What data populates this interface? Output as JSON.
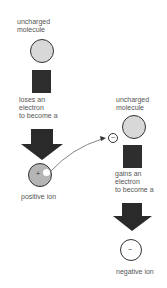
{
  "left": {
    "top_label": [
      "uncharged",
      "molecule"
    ],
    "step_label": [
      "loses an",
      "electron",
      "to become a"
    ],
    "result_label": "positive ion",
    "ion_sign": "+"
  },
  "right": {
    "top_label": [
      "uncharged",
      "molecule"
    ],
    "step_label": [
      "gains an",
      "electron",
      "to become a"
    ],
    "result_label": "negative ion",
    "ion_sign": "−",
    "electron_sign": "−"
  },
  "colors": {
    "molecule_fill": "#d8d8d8",
    "positive_ion_fill": "#b5b5b5",
    "square_fill": "#2e2e2e",
    "arrow_fill": "#2a2a2a"
  }
}
